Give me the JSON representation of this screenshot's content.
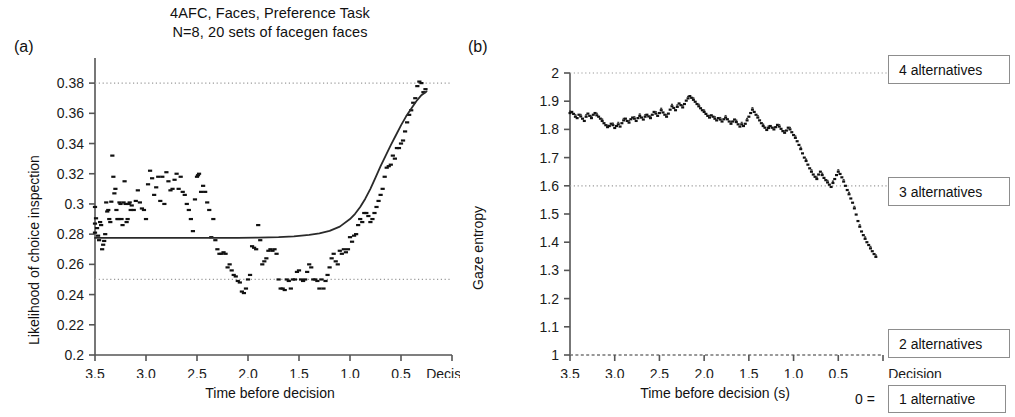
{
  "figure": {
    "title_line1": "4AFC, Faces,  Preference Task",
    "title_line2": "N=8, 20 sets of facegen faces",
    "panel_a_tag": "(a)",
    "panel_b_tag": "(b)"
  },
  "chart_data": [
    {
      "type": "scatter",
      "panel": "(a)",
      "title": "4AFC, Faces, Preference Task / N=8, 20 sets of facegen faces",
      "xlabel": "Time before decision",
      "ylabel": "Likelihood of choice inspection",
      "xlim": [
        3.5,
        0.0
      ],
      "ylim": [
        0.2,
        0.39
      ],
      "x_ticks": [
        "3.5",
        "3.0",
        "2.5",
        "2.0",
        "1.5",
        "1.0",
        "0.5"
      ],
      "x_tick_values": [
        3.5,
        3.0,
        2.5,
        2.0,
        1.5,
        1.0,
        0.5
      ],
      "x_end_label": "Decision",
      "y_ticks": [
        "0.2",
        "0.22",
        "0.24",
        "0.26",
        "0.28",
        "0.3",
        "0.32",
        "0.34",
        "0.36",
        "0.38"
      ],
      "y_tick_values": [
        0.2,
        0.22,
        0.24,
        0.26,
        0.28,
        0.3,
        0.32,
        0.34,
        0.36,
        0.38
      ],
      "grid": false,
      "reference_lines": [
        {
          "y": 0.38,
          "style": "dotted",
          "label": ""
        },
        {
          "y": 0.25,
          "style": "dotted",
          "label": ""
        }
      ],
      "fit_curve": {
        "name": "sigmoid fit",
        "style": "solid",
        "x": [
          3.5,
          3.3,
          3.1,
          2.9,
          2.7,
          2.5,
          2.3,
          2.1,
          1.9,
          1.7,
          1.55,
          1.4,
          1.3,
          1.2,
          1.1,
          1.0,
          0.95,
          0.9,
          0.85,
          0.8,
          0.75,
          0.7,
          0.65,
          0.6,
          0.55,
          0.5,
          0.45,
          0.4,
          0.35,
          0.3,
          0.25
        ],
        "y": [
          0.2775,
          0.2775,
          0.2775,
          0.2775,
          0.2775,
          0.2775,
          0.2775,
          0.2775,
          0.2777,
          0.278,
          0.2785,
          0.2795,
          0.2805,
          0.2822,
          0.285,
          0.29,
          0.2935,
          0.298,
          0.3035,
          0.31,
          0.3175,
          0.325,
          0.332,
          0.339,
          0.3455,
          0.352,
          0.358,
          0.363,
          0.368,
          0.372,
          0.3745
        ]
      },
      "points": {
        "x": [
          3.5,
          3.5,
          3.5,
          3.49,
          3.48,
          3.47,
          3.46,
          3.45,
          3.44,
          3.43,
          3.42,
          3.41,
          3.4,
          3.39,
          3.38,
          3.37,
          3.36,
          3.35,
          3.34,
          3.33,
          3.32,
          3.31,
          3.3,
          3.29,
          3.28,
          3.27,
          3.26,
          3.25,
          3.24,
          3.23,
          3.22,
          3.21,
          3.2,
          3.19,
          3.18,
          3.17,
          3.16,
          3.15,
          3.14,
          3.12,
          3.1,
          3.08,
          3.06,
          3.04,
          3.02,
          3.0,
          2.98,
          2.96,
          2.94,
          2.92,
          2.9,
          2.88,
          2.86,
          2.84,
          2.82,
          2.8,
          2.78,
          2.76,
          2.74,
          2.72,
          2.7,
          2.68,
          2.66,
          2.64,
          2.62,
          2.6,
          2.58,
          2.56,
          2.54,
          2.52,
          2.5,
          2.49,
          2.48,
          2.46,
          2.44,
          2.42,
          2.4,
          2.38,
          2.36,
          2.34,
          2.32,
          2.3,
          2.28,
          2.26,
          2.24,
          2.22,
          2.2,
          2.18,
          2.16,
          2.14,
          2.12,
          2.1,
          2.08,
          2.06,
          2.04,
          2.02,
          2.0,
          1.98,
          1.96,
          1.94,
          1.92,
          1.9,
          1.88,
          1.86,
          1.84,
          1.82,
          1.8,
          1.78,
          1.76,
          1.74,
          1.72,
          1.7,
          1.68,
          1.66,
          1.64,
          1.62,
          1.6,
          1.58,
          1.56,
          1.54,
          1.52,
          1.5,
          1.48,
          1.46,
          1.44,
          1.42,
          1.4,
          1.38,
          1.36,
          1.34,
          1.32,
          1.3,
          1.28,
          1.26,
          1.24,
          1.22,
          1.2,
          1.18,
          1.16,
          1.14,
          1.12,
          1.1,
          1.08,
          1.06,
          1.04,
          1.02,
          1.0,
          0.98,
          0.96,
          0.94,
          0.92,
          0.9,
          0.88,
          0.86,
          0.84,
          0.82,
          0.8,
          0.78,
          0.76,
          0.74,
          0.72,
          0.7,
          0.68,
          0.66,
          0.64,
          0.62,
          0.6,
          0.58,
          0.56,
          0.54,
          0.52,
          0.5,
          0.48,
          0.46,
          0.44,
          0.42,
          0.4,
          0.38,
          0.36,
          0.34,
          0.32,
          0.3,
          0.28,
          0.26
        ],
        "y": [
          0.298,
          0.287,
          0.281,
          0.2905,
          0.284,
          0.279,
          0.276,
          0.288,
          0.286,
          0.27,
          0.273,
          0.2755,
          0.28,
          0.301,
          0.295,
          0.296,
          0.29,
          0.288,
          0.3015,
          0.332,
          0.318,
          0.307,
          0.31,
          0.296,
          0.29,
          0.29,
          0.301,
          0.3,
          0.29,
          0.286,
          0.301,
          0.315,
          0.3,
          0.288,
          0.29,
          0.3,
          0.301,
          0.296,
          0.299,
          0.296,
          0.302,
          0.309,
          0.301,
          0.297,
          0.296,
          0.29,
          0.313,
          0.322,
          0.317,
          0.306,
          0.311,
          0.318,
          0.302,
          0.318,
          0.3,
          0.321,
          0.315,
          0.309,
          0.31,
          0.316,
          0.32,
          0.31,
          0.318,
          0.308,
          0.306,
          0.3,
          0.296,
          0.29,
          0.282,
          0.303,
          0.318,
          0.319,
          0.32,
          0.308,
          0.312,
          0.308,
          0.301,
          0.296,
          0.278,
          0.29,
          0.276,
          0.27,
          0.267,
          0.267,
          0.268,
          0.267,
          0.258,
          0.26,
          0.256,
          0.253,
          0.252,
          0.249,
          0.248,
          0.242,
          0.241,
          0.244,
          0.25,
          0.253,
          0.272,
          0.271,
          0.27,
          0.286,
          0.276,
          0.26,
          0.262,
          0.264,
          0.269,
          0.27,
          0.269,
          0.27,
          0.267,
          0.25,
          0.244,
          0.244,
          0.243,
          0.25,
          0.249,
          0.244,
          0.25,
          0.25,
          0.255,
          0.256,
          0.25,
          0.249,
          0.25,
          0.255,
          0.26,
          0.258,
          0.25,
          0.25,
          0.249,
          0.244,
          0.25,
          0.244,
          0.249,
          0.253,
          0.258,
          0.264,
          0.267,
          0.262,
          0.26,
          0.269,
          0.267,
          0.27,
          0.268,
          0.27,
          0.278,
          0.275,
          0.279,
          0.28,
          0.286,
          0.29,
          0.288,
          0.294,
          0.294,
          0.292,
          0.288,
          0.29,
          0.294,
          0.298,
          0.302,
          0.306,
          0.31,
          0.318,
          0.324,
          0.325,
          0.326,
          0.332,
          0.33,
          0.337,
          0.337,
          0.34,
          0.342,
          0.348,
          0.354,
          0.359,
          0.362,
          0.367,
          0.37,
          0.378,
          0.381,
          0.38,
          0.374,
          0.376,
          0.356,
          0.362,
          0.368,
          0.379,
          0.381,
          0.37,
          0.375,
          0.379,
          0.381
        ]
      }
    },
    {
      "type": "scatter",
      "panel": "(b)",
      "title": "",
      "xlabel": "Time before decision (s)",
      "ylabel": "Gaze entropy",
      "xlim": [
        3.5,
        0.0
      ],
      "ylim": [
        1.0,
        2.0
      ],
      "x_ticks": [
        "3.5",
        "3.0",
        "2.5",
        "2.0",
        "1.5",
        "1.0",
        "0.5"
      ],
      "x_tick_values": [
        3.5,
        3.0,
        2.5,
        2.0,
        1.5,
        1.0,
        0.5
      ],
      "x_end_label": "Decision",
      "zero_equals_label": "0 =",
      "y_ticks": [
        "1",
        "1.1",
        "1.2",
        "1.3",
        "1.4",
        "1.5",
        "1.6",
        "1.7",
        "1.8",
        "1.9",
        "2"
      ],
      "y_tick_values": [
        1.0,
        1.1,
        1.2,
        1.3,
        1.4,
        1.5,
        1.6,
        1.7,
        1.8,
        1.9,
        2.0
      ],
      "grid": false,
      "reference_lines": [
        {
          "y": 2.0,
          "style": "dotted",
          "label": "4 alternatives"
        },
        {
          "y": 1.6,
          "style": "dotted",
          "label": "3 alternatives"
        },
        {
          "y": 1.0,
          "style": "dotted",
          "label": "2 alternatives"
        }
      ],
      "annotations": [
        {
          "id": "four-alternatives",
          "label": "4 alternatives",
          "y": 2.0
        },
        {
          "id": "three-alternatives",
          "label": "3 alternatives",
          "y": 1.6
        },
        {
          "id": "two-alternatives",
          "label": "2 alternatives",
          "y": 1.02
        },
        {
          "id": "one-alternative",
          "label": "1 alternative",
          "y": 0.94
        }
      ],
      "points": {
        "x": [
          3.5,
          3.48,
          3.46,
          3.44,
          3.42,
          3.4,
          3.38,
          3.36,
          3.34,
          3.32,
          3.3,
          3.28,
          3.26,
          3.24,
          3.22,
          3.2,
          3.18,
          3.16,
          3.14,
          3.12,
          3.1,
          3.08,
          3.06,
          3.04,
          3.02,
          3.0,
          2.98,
          2.96,
          2.94,
          2.92,
          2.9,
          2.88,
          2.86,
          2.84,
          2.82,
          2.8,
          2.78,
          2.76,
          2.74,
          2.72,
          2.7,
          2.68,
          2.66,
          2.64,
          2.62,
          2.6,
          2.58,
          2.56,
          2.54,
          2.52,
          2.5,
          2.48,
          2.46,
          2.44,
          2.42,
          2.4,
          2.38,
          2.36,
          2.34,
          2.32,
          2.3,
          2.28,
          2.26,
          2.24,
          2.22,
          2.2,
          2.18,
          2.16,
          2.14,
          2.12,
          2.1,
          2.08,
          2.06,
          2.04,
          2.02,
          2.0,
          1.98,
          1.96,
          1.94,
          1.92,
          1.9,
          1.88,
          1.86,
          1.84,
          1.82,
          1.8,
          1.78,
          1.76,
          1.74,
          1.72,
          1.7,
          1.68,
          1.66,
          1.64,
          1.62,
          1.6,
          1.58,
          1.56,
          1.54,
          1.52,
          1.5,
          1.48,
          1.46,
          1.44,
          1.42,
          1.4,
          1.38,
          1.36,
          1.34,
          1.32,
          1.3,
          1.28,
          1.26,
          1.24,
          1.22,
          1.2,
          1.18,
          1.16,
          1.14,
          1.12,
          1.1,
          1.08,
          1.06,
          1.04,
          1.02,
          1.0,
          0.98,
          0.96,
          0.94,
          0.92,
          0.9,
          0.88,
          0.86,
          0.84,
          0.82,
          0.8,
          0.78,
          0.76,
          0.74,
          0.72,
          0.7,
          0.68,
          0.66,
          0.64,
          0.62,
          0.6,
          0.58,
          0.56,
          0.54,
          0.52,
          0.5,
          0.48,
          0.46,
          0.44,
          0.42,
          0.4,
          0.38,
          0.36,
          0.34,
          0.32,
          0.3,
          0.28,
          0.26,
          0.24,
          0.22,
          0.2,
          0.18,
          0.16,
          0.14,
          0.12,
          0.1,
          0.08
        ],
        "y": [
          1.858,
          1.862,
          1.855,
          1.845,
          1.84,
          1.852,
          1.846,
          1.838,
          1.83,
          1.845,
          1.856,
          1.848,
          1.84,
          1.852,
          1.858,
          1.85,
          1.845,
          1.838,
          1.83,
          1.822,
          1.815,
          1.808,
          1.812,
          1.82,
          1.815,
          1.805,
          1.812,
          1.818,
          1.81,
          1.822,
          1.832,
          1.838,
          1.83,
          1.824,
          1.836,
          1.842,
          1.838,
          1.83,
          1.84,
          1.848,
          1.842,
          1.835,
          1.845,
          1.852,
          1.846,
          1.84,
          1.852,
          1.862,
          1.856,
          1.848,
          1.858,
          1.868,
          1.86,
          1.852,
          1.845,
          1.856,
          1.87,
          1.882,
          1.876,
          1.868,
          1.88,
          1.892,
          1.886,
          1.878,
          1.89,
          1.902,
          1.91,
          1.918,
          1.912,
          1.905,
          1.898,
          1.89,
          1.882,
          1.875,
          1.868,
          1.862,
          1.855,
          1.848,
          1.842,
          1.85,
          1.845,
          1.838,
          1.832,
          1.84,
          1.835,
          1.828,
          1.836,
          1.842,
          1.836,
          1.828,
          1.82,
          1.828,
          1.835,
          1.826,
          1.818,
          1.81,
          1.818,
          1.812,
          1.82,
          1.832,
          1.845,
          1.858,
          1.87,
          1.862,
          1.852,
          1.842,
          1.832,
          1.822,
          1.812,
          1.806,
          1.798,
          1.805,
          1.812,
          1.806,
          1.8,
          1.808,
          1.816,
          1.81,
          1.802,
          1.794,
          1.788,
          1.796,
          1.806,
          1.8,
          1.79,
          1.78,
          1.77,
          1.758,
          1.745,
          1.73,
          1.715,
          1.7,
          1.688,
          1.675,
          1.662,
          1.65,
          1.64,
          1.632,
          1.624,
          1.64,
          1.65,
          1.638,
          1.628,
          1.62,
          1.612,
          1.604,
          1.596,
          1.61,
          1.624,
          1.638,
          1.65,
          1.642,
          1.63,
          1.615,
          1.6,
          1.585,
          1.57,
          1.555,
          1.54,
          1.52,
          1.498,
          1.475,
          1.455,
          1.438,
          1.425,
          1.412,
          1.4,
          1.39,
          1.378,
          1.368,
          1.358,
          1.348,
          1.34,
          1.338,
          1.34
        ]
      }
    }
  ],
  "panel_a": {
    "ylabel": "Likelihood of choice inspection",
    "xlabel": "Time before decision",
    "y_ticks": [
      "0.38",
      "0.36",
      "0.34",
      "0.32",
      "0.3",
      "0.28",
      "0.26",
      "0.24",
      "0.22",
      "0.2"
    ],
    "x_ticks": [
      "3.5",
      "3.0",
      "2.5",
      "2.0",
      "1.5",
      "1.0",
      "0.5"
    ],
    "decision_label": "Decision"
  },
  "panel_b": {
    "ylabel": "Gaze entropy",
    "xlabel": "Time before decision (s)",
    "y_ticks": [
      "2",
      "1.9",
      "1.8",
      "1.7",
      "1.6",
      "1.5",
      "1.4",
      "1.3",
      "1.2",
      "1.1",
      "1"
    ],
    "x_ticks": [
      "3.5",
      "3.0",
      "2.5",
      "2.0",
      "1.5",
      "1.0",
      "0.5"
    ],
    "decision_label": "Decision",
    "zero_equals": "0 =",
    "annotations": {
      "four": "4 alternatives",
      "three": "3 alternatives",
      "two": "2 alternatives",
      "one": "1 alternative"
    }
  },
  "colors": {
    "ink": "#1a1a1a",
    "axis": "#555555",
    "dotted": "#9a9a9a",
    "box_border": "#8d8d8d",
    "marker": "#111111"
  }
}
